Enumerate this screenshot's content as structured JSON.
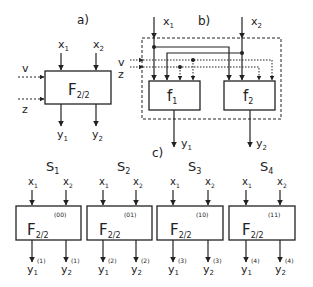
{
  "panel_a": {
    "label": "a)",
    "inputs": [
      "x",
      "x"
    ],
    "input_subs": [
      "1",
      "2"
    ],
    "side_inputs": [
      "v",
      "z"
    ],
    "block": {
      "name": "F",
      "sub": "2/2"
    },
    "outputs": [
      "y",
      "y"
    ],
    "output_subs": [
      "1",
      "2"
    ]
  },
  "panel_b": {
    "label": "b)",
    "inputs": [
      "x",
      "x"
    ],
    "input_subs": [
      "1",
      "2"
    ],
    "side_inputs": [
      "v",
      "z"
    ],
    "blocks": [
      {
        "name": "f",
        "sub": "1"
      },
      {
        "name": "f",
        "sub": "2"
      }
    ],
    "outputs": [
      "y",
      "y"
    ],
    "output_subs": [
      "1",
      "2"
    ]
  },
  "panel_c": {
    "label": "c)",
    "states": [
      {
        "name": "S",
        "sub": "1",
        "code": "(00)",
        "sup": "(1)"
      },
      {
        "name": "S",
        "sub": "2",
        "code": "(01)",
        "sup": "(2)"
      },
      {
        "name": "S",
        "sub": "3",
        "code": "(10)",
        "sup": "(3)"
      },
      {
        "name": "S",
        "sub": "4",
        "code": "(11)",
        "sup": "(4)"
      }
    ],
    "block": {
      "name": "F",
      "sub": "2/2"
    },
    "inputs": [
      "x",
      "x"
    ],
    "input_subs": [
      "1",
      "2"
    ],
    "outputs": [
      "y",
      "y"
    ],
    "output_subs": [
      "1",
      "2"
    ]
  },
  "colors": {
    "line": "#222222",
    "background": "#ffffff"
  }
}
